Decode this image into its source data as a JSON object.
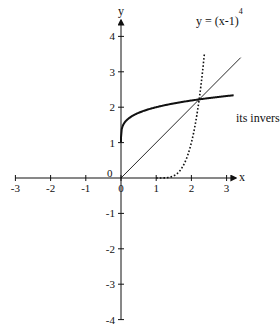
{
  "chart_data": {
    "type": "line",
    "title": "",
    "xlabel": "x",
    "ylabel": "y",
    "xlim": [
      -3,
      3
    ],
    "ylim": [
      -4,
      4
    ],
    "grid": false,
    "x_ticks": [
      "-3",
      "-2",
      "-1",
      "0",
      "1",
      "2",
      "3"
    ],
    "y_ticks": [
      "4",
      "3",
      "2",
      "1",
      "-1",
      "-2",
      "-3",
      "-4"
    ],
    "origin_label": "0",
    "series": [
      {
        "name": "y = (x-1)^4",
        "style": "dotted",
        "x": [
          1.0,
          1.25,
          1.5,
          1.75,
          2.0,
          2.2,
          2.35
        ],
        "y": [
          0.0,
          0.004,
          0.06,
          0.32,
          1.0,
          2.07,
          3.32
        ]
      },
      {
        "name": "its inverse",
        "style": "solid-thick",
        "x": [
          0.0,
          0.01,
          0.1,
          0.5,
          1.0,
          1.5,
          2.0,
          2.5,
          3.2
        ],
        "y": [
          1.0,
          1.32,
          1.56,
          1.84,
          2.0,
          2.11,
          2.19,
          2.26,
          2.34
        ]
      },
      {
        "name": "y = x",
        "style": "solid-thin",
        "x": [
          0.0,
          3.4
        ],
        "y": [
          0.0,
          3.4
        ]
      }
    ],
    "annotations": [
      {
        "text": "y = (x-1)",
        "superscript": "4",
        "near": "top of dotted curve"
      },
      {
        "text": "its inverse",
        "near": "right end of thick curve"
      }
    ]
  },
  "labels": {
    "x_axis": "x",
    "y_axis": "y",
    "origin": "0",
    "curve_formula": "y = (x-1)",
    "curve_exponent": "4",
    "inverse": "its inverse"
  }
}
